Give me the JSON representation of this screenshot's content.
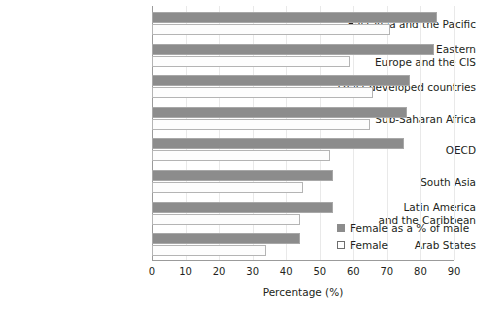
{
  "chart_data": {
    "type": "bar",
    "orientation": "horizontal",
    "title": "",
    "xlabel": "Percentage (%)",
    "ylabel": "",
    "xlim": [
      0,
      90
    ],
    "xticks": [
      0,
      10,
      20,
      30,
      40,
      50,
      60,
      70,
      80,
      90
    ],
    "grid": true,
    "legend_position": "inside-right",
    "categories": [
      "East Asia and the Pacific",
      "Central and Eastern Europe and the CIS",
      "Least developed countries",
      "Sub-Saharan Africa",
      "OECD",
      "South Asia",
      "Latin America and the Caribbean",
      "Arab States"
    ],
    "category_lines": [
      [
        "East Asia and the Pacific"
      ],
      [
        "Central and Eastern",
        "Europe and the CIS"
      ],
      [
        "Least developed countries"
      ],
      [
        "Sub-Saharan Africa"
      ],
      [
        "OECD"
      ],
      [
        "South Asia"
      ],
      [
        "Latin America",
        "and the Caribbean"
      ],
      [
        "Arab States"
      ]
    ],
    "series": [
      {
        "name": "Female as a % of male",
        "color": "#8c8c8c",
        "values": [
          85,
          84,
          77,
          76,
          75,
          54,
          54,
          44
        ]
      },
      {
        "name": "Female",
        "color": "#ffffff",
        "values": [
          71,
          59,
          66,
          65,
          53,
          45,
          44,
          34
        ]
      }
    ]
  },
  "legend": {
    "items": [
      {
        "label": "Female as a % of male",
        "style": "filled"
      },
      {
        "label": "Female",
        "style": "hollow"
      }
    ]
  },
  "axis": {
    "x_title": "Percentage (%)",
    "x_tick_labels": [
      "0",
      "10",
      "20",
      "30",
      "40",
      "50",
      "60",
      "70",
      "80",
      "90"
    ]
  },
  "colors": {
    "bar_ratio": "#8c8c8c",
    "bar_female": "#fdfdfd",
    "bar_female_border": "#b4b4b4",
    "axis": "#9b9b9b",
    "grid": "#e9e9e9",
    "text": "#231f20",
    "background": "#ffffff"
  }
}
